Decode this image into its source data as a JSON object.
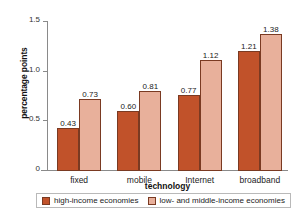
{
  "chart_data": {
    "type": "bar",
    "title": "",
    "subtitle": "",
    "xlabel": "technology",
    "ylabel": "percentage points",
    "categories": [
      "fixed",
      "mobile",
      "Internet",
      "broadband"
    ],
    "series": [
      {
        "name": "high-income economies",
        "color": "#C1522A",
        "values": [
          0.43,
          0.6,
          0.77,
          1.21
        ],
        "labels": [
          "0.43",
          "0.60",
          "0.77",
          "1.21"
        ]
      },
      {
        "name": "low- and middle-income economies",
        "color": "#E8B09B",
        "values": [
          0.73,
          0.81,
          1.12,
          1.38
        ],
        "labels": [
          "0.73",
          "0.81",
          "1.12",
          "1.38"
        ]
      }
    ],
    "ylim": [
      0,
      1.5
    ],
    "yticks": [
      0,
      0.5,
      1.0,
      1.5
    ],
    "ytick_labels": [
      "0",
      "0.5",
      "1.0",
      "1.5"
    ],
    "grid": false,
    "legend_position": "bottom"
  }
}
